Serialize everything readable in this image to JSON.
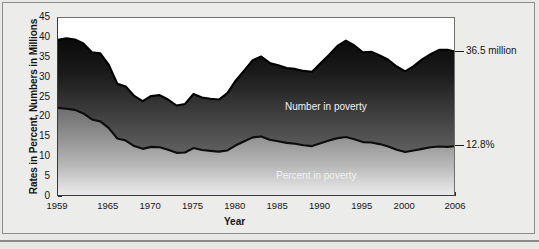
{
  "chart_data": {
    "type": "area",
    "title": "",
    "xlabel": "Year",
    "ylabel": "Rates in Percent, Numbers in Millions",
    "xlim": [
      1959,
      2006
    ],
    "ylim": [
      0,
      45
    ],
    "ytick_labels": [
      "45",
      "40",
      "35",
      "30",
      "25",
      "20",
      "15",
      "10",
      "5",
      "0"
    ],
    "ytick_values": [
      45,
      40,
      35,
      30,
      25,
      20,
      15,
      10,
      5,
      0
    ],
    "xtick_labels": [
      "1959",
      "1965",
      "1970",
      "1975",
      "1980",
      "1985",
      "1990",
      "1995",
      "2000",
      "2006"
    ],
    "xtick_values": [
      1959,
      1965,
      1970,
      1975,
      1980,
      1985,
      1990,
      1995,
      2000,
      2006
    ],
    "grid": false,
    "legend": "in-plot annotations",
    "annotations": [
      {
        "name": "number-endpoint",
        "text": "36.5 million",
        "x": 2006,
        "y": 36.5
      },
      {
        "name": "percent-endpoint",
        "text": "12.8%",
        "x": 2006,
        "y": 12.8
      },
      {
        "name": "number-series-label",
        "text": "Number in poverty"
      },
      {
        "name": "percent-series-label",
        "text": "Percent in poverty"
      }
    ],
    "x": [
      1959,
      1960,
      1961,
      1962,
      1963,
      1964,
      1965,
      1966,
      1967,
      1968,
      1969,
      1970,
      1971,
      1972,
      1973,
      1974,
      1975,
      1976,
      1977,
      1978,
      1979,
      1980,
      1981,
      1982,
      1983,
      1984,
      1985,
      1986,
      1987,
      1988,
      1989,
      1990,
      1991,
      1992,
      1993,
      1994,
      1995,
      1996,
      1997,
      1998,
      1999,
      2000,
      2001,
      2002,
      2003,
      2004,
      2005,
      2006
    ],
    "series": [
      {
        "name": "Number in poverty",
        "units": "millions",
        "values": [
          39.5,
          39.9,
          39.6,
          38.6,
          36.4,
          36.1,
          33.2,
          28.5,
          27.8,
          25.4,
          24.1,
          25.4,
          25.6,
          24.5,
          23.0,
          23.4,
          25.9,
          25.0,
          24.7,
          24.5,
          26.1,
          29.3,
          31.8,
          34.4,
          35.3,
          33.7,
          33.1,
          32.4,
          32.2,
          31.7,
          31.5,
          33.6,
          35.7,
          38.0,
          39.3,
          38.1,
          36.4,
          36.5,
          35.6,
          34.5,
          32.8,
          31.6,
          32.9,
          34.6,
          35.9,
          37.0,
          37.0,
          36.5
        ]
      },
      {
        "name": "Percent in poverty",
        "units": "percent",
        "values": [
          22.4,
          22.2,
          21.9,
          21.0,
          19.5,
          19.0,
          17.3,
          14.7,
          14.2,
          12.8,
          12.1,
          12.6,
          12.5,
          11.9,
          11.1,
          11.2,
          12.3,
          11.8,
          11.6,
          11.4,
          11.7,
          13.0,
          14.0,
          15.0,
          15.2,
          14.4,
          14.0,
          13.6,
          13.4,
          13.0,
          12.8,
          13.5,
          14.2,
          14.8,
          15.1,
          14.5,
          13.8,
          13.7,
          13.3,
          12.7,
          11.9,
          11.3,
          11.7,
          12.1,
          12.5,
          12.7,
          12.6,
          12.8
        ]
      }
    ]
  },
  "footer": {
    "note": ""
  }
}
